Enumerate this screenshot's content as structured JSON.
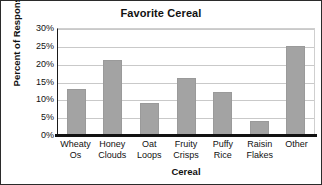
{
  "chart_data": {
    "type": "bar",
    "title": "Favorite Cereal",
    "xlabel": "Cereal",
    "ylabel": "Percent of Responses",
    "categories": [
      "Wheaty Os",
      "Honey Clouds",
      "Oat Loops",
      "Fruity Crisps",
      "Puffy Rice",
      "Raisin Flakes",
      "Other"
    ],
    "category_lines": [
      [
        "Wheaty",
        "Os"
      ],
      [
        "Honey",
        "Clouds"
      ],
      [
        "Oat",
        "Loops"
      ],
      [
        "Fruity",
        "Crisps"
      ],
      [
        "Puffy",
        "Rice"
      ],
      [
        "Raisin",
        "Flakes"
      ],
      [
        "Other"
      ]
    ],
    "values": [
      13,
      21,
      9,
      16,
      12,
      4,
      25
    ],
    "ylim": [
      0,
      30
    ],
    "ytick_values": [
      0,
      5,
      10,
      15,
      20,
      25,
      30
    ],
    "ytick_labels": [
      "0%",
      "5%",
      "10%",
      "15%",
      "20%",
      "25%",
      "30%"
    ],
    "grid": true,
    "legend": false,
    "bar_color": "#a3a3a3",
    "axis_color": "#121212",
    "grid_color": "#c9c9c9",
    "background": "#ffffff"
  }
}
